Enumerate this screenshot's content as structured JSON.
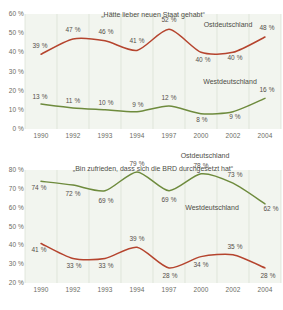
{
  "figure": {
    "top_mark": "",
    "background": "#ffffff",
    "panel_bg": "#f2f5ef",
    "gridline_color": "#d9e0d2",
    "text_color": "#6b6b63",
    "color_ost": "#b5442e",
    "color_west": "#6e8b3d"
  },
  "chart_data": [
    {
      "type": "line",
      "title": "„Hätte lieber neuen Staat gehabt“",
      "xlabel": "",
      "ylabel": "",
      "categories": [
        "1990",
        "1992",
        "1993",
        "1994",
        "1997",
        "2000",
        "2002",
        "2004"
      ],
      "x": [
        1990,
        1992,
        1993,
        1994,
        1997,
        2000,
        2002,
        2004
      ],
      "ylim": [
        0,
        60
      ],
      "yticks": [
        "0 %",
        "10 %",
        "20 %",
        "30 %",
        "40 %",
        "50 %",
        "60 %"
      ],
      "ytick_values": [
        0,
        10,
        20,
        30,
        40,
        50,
        60
      ],
      "grid": "vertical",
      "legend_position": "inline-right",
      "series": [
        {
          "name": "Ostdeutschland",
          "color": "#b5442e",
          "values": [
            39,
            47,
            46,
            41,
            52,
            40,
            40,
            48
          ],
          "labels": [
            "39 %",
            "47 %",
            "46 %",
            "41 %",
            "52 %",
            "40 %",
            "40 %",
            "48 %"
          ]
        },
        {
          "name": "Westdeutschland",
          "color": "#6e8b3d",
          "values": [
            13,
            11,
            10,
            9,
            12,
            8,
            9,
            16
          ],
          "labels": [
            "13 %",
            "11 %",
            "10 %",
            "9 %",
            "12 %",
            "8 %",
            "9 %",
            "16 %"
          ]
        }
      ]
    },
    {
      "type": "line",
      "title": "„Bin zufrieden, dass sich die BRD durchgesetzt hat“",
      "xlabel": "",
      "ylabel": "",
      "categories": [
        "1990",
        "1992",
        "1993",
        "1994",
        "1997",
        "2000",
        "2002",
        "2004"
      ],
      "x": [
        1990,
        1992,
        1993,
        1994,
        1997,
        2000,
        2002,
        2004
      ],
      "ylim": [
        20,
        80
      ],
      "yticks": [
        "20 %",
        "30 %",
        "40 %",
        "50 %",
        "60 %",
        "70 %",
        "80 %"
      ],
      "ytick_values": [
        20,
        30,
        40,
        50,
        60,
        70,
        80
      ],
      "grid": "vertical",
      "legend_position": "inline-right",
      "series": [
        {
          "name": "Westdeutschland",
          "color": "#6e8b3d",
          "values": [
            74,
            72,
            69,
            79,
            69,
            78,
            73,
            62
          ],
          "labels": [
            "74 %",
            "72 %",
            "69 %",
            "79 %",
            "69 %",
            "78 %",
            "73 %",
            "62 %"
          ]
        },
        {
          "name": "Ostdeutschland",
          "color": "#b5442e",
          "values": [
            41,
            33,
            33,
            39,
            28,
            34,
            35,
            28
          ],
          "labels": [
            "41 %",
            "33 %",
            "33 %",
            "39 %",
            "28 %",
            "34 %",
            "35 %",
            "28 %"
          ]
        }
      ]
    }
  ]
}
